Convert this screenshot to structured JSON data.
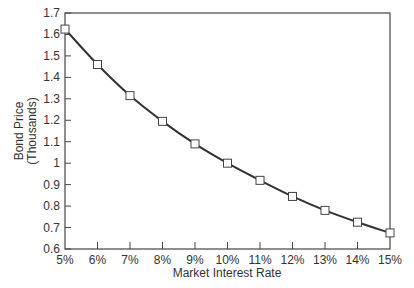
{
  "chart_data": {
    "type": "line",
    "title": "",
    "xlabel": "Market Interest Rate",
    "ylabel": "Bond Price",
    "ylabel_sub": "(Thousands)",
    "categories": [
      "5%",
      "6%",
      "7%",
      "8%",
      "9%",
      "10%",
      "11%",
      "12%",
      "13%",
      "14%",
      "15%"
    ],
    "x": [
      5,
      6,
      7,
      8,
      9,
      10,
      11,
      12,
      13,
      14,
      15
    ],
    "series": [
      {
        "name": "Bond Price",
        "values": [
          1.625,
          1.46,
          1.315,
          1.195,
          1.09,
          1.0,
          0.92,
          0.845,
          0.78,
          0.725,
          0.675
        ],
        "marker": "open-square",
        "color": "#333333"
      }
    ],
    "yticks": [
      "0.6",
      "0.7",
      "0.8",
      "0.9",
      "1",
      "1.1",
      "1.2",
      "1.3",
      "1.4",
      "1.5",
      "1.6",
      "1.7"
    ],
    "ylim": [
      0.6,
      1.7
    ],
    "xlim": [
      5,
      15
    ],
    "grid": false,
    "legend": null
  }
}
